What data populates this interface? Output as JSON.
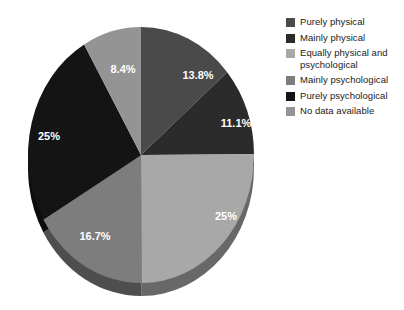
{
  "chart_data": {
    "type": "pie",
    "title": "",
    "subtitle": "",
    "xlabel": "",
    "ylabel": "",
    "grid": false,
    "legend_position": "right",
    "start_angle_deg": 0,
    "direction": "clockwise",
    "style": "3d-grayscale",
    "categories": [
      "Purely physical",
      "Mainly physical",
      "Equally physical and psychological",
      "Mainly psychological",
      "Purely psychological",
      "No data available"
    ],
    "values": [
      13.8,
      11.1,
      25,
      16.7,
      25,
      8.4
    ],
    "labels": [
      "13.8%",
      "11.1%",
      "25%",
      "16.7%",
      "25%",
      "8.4%"
    ],
    "colors": [
      "#4a4a4a",
      "#2b2b2b",
      "#a8a8a8",
      "#7d7d7d",
      "#141414",
      "#949494"
    ],
    "slices": [
      {
        "name": "Purely physical",
        "value": 13.8,
        "label": "13.8%",
        "color": "#4a4a4a",
        "label_x": 198,
        "label_y": 76
      },
      {
        "name": "Mainly physical",
        "value": 11.1,
        "label": "11.1%",
        "color": "#2b2b2b",
        "label_x": 236,
        "label_y": 124
      },
      {
        "name": "Equally physical and psychological",
        "value": 25,
        "label": "25%",
        "color": "#a8a8a8",
        "label_x": 226,
        "label_y": 217
      },
      {
        "name": "Mainly psychological",
        "value": 16.7,
        "label": "16.7%",
        "color": "#7d7d7d",
        "label_x": 95,
        "label_y": 237
      },
      {
        "name": "Purely psychological",
        "value": 25,
        "label": "25%",
        "color": "#141414",
        "label_x": 49,
        "label_y": 137
      },
      {
        "name": "No data available",
        "value": 8.4,
        "label": "8.4%",
        "color": "#949494",
        "label_x": 123,
        "label_y": 70
      }
    ]
  },
  "legend": {
    "items": [
      {
        "label": "Purely physical",
        "color": "#4a4a4a"
      },
      {
        "label": "Mainly physical",
        "color": "#2b2b2b"
      },
      {
        "label": "Equally physical and psychological",
        "color": "#a8a8a8"
      },
      {
        "label": "Mainly psychological",
        "color": "#7d7d7d"
      },
      {
        "label": "Purely psychological",
        "color": "#141414"
      },
      {
        "label": "No data available",
        "color": "#949494"
      }
    ]
  }
}
